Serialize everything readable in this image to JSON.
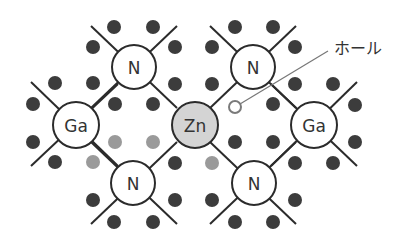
{
  "diagram": {
    "title_partial": "",
    "colors": {
      "electron": "#3c3c3c",
      "electron_light": "#9a9a9a",
      "atom_fill": "#ffffff",
      "zn_fill": "#d4d4d4",
      "hole_stroke": "#7a7a7a",
      "bond": "#2b2b2b"
    },
    "atoms": [
      {
        "id": "n-top-left",
        "label": "N",
        "x": 134,
        "y": 67,
        "r": 22,
        "fill": "#ffffff"
      },
      {
        "id": "n-top-right",
        "label": "N",
        "x": 253,
        "y": 67,
        "r": 22,
        "fill": "#ffffff"
      },
      {
        "id": "ga-left",
        "label": "Ga",
        "x": 76,
        "y": 125,
        "r": 23,
        "fill": "#ffffff"
      },
      {
        "id": "zn-center",
        "label": "Zn",
        "x": 195,
        "y": 125,
        "r": 23,
        "fill": "#d4d4d4"
      },
      {
        "id": "ga-right",
        "label": "Ga",
        "x": 314,
        "y": 125,
        "r": 23,
        "fill": "#ffffff"
      },
      {
        "id": "n-bottom-left",
        "label": "N",
        "x": 133,
        "y": 183,
        "r": 22,
        "fill": "#ffffff"
      },
      {
        "id": "n-bottom-right",
        "label": "N",
        "x": 254,
        "y": 183,
        "r": 22,
        "fill": "#ffffff"
      }
    ],
    "bonds": [
      {
        "x1": 91,
        "y1": 26,
        "x2": 177,
        "y2": 108
      },
      {
        "x1": 177,
        "y1": 26,
        "x2": 91,
        "y2": 108
      },
      {
        "x1": 210,
        "y1": 26,
        "x2": 296,
        "y2": 108
      },
      {
        "x1": 296,
        "y1": 26,
        "x2": 210,
        "y2": 108
      },
      {
        "x1": 31,
        "y1": 82,
        "x2": 118,
        "y2": 166
      },
      {
        "x1": 118,
        "y1": 84,
        "x2": 31,
        "y2": 166
      },
      {
        "x1": 91,
        "y1": 142,
        "x2": 177,
        "y2": 224
      },
      {
        "x1": 177,
        "y1": 142,
        "x2": 91,
        "y2": 224
      },
      {
        "x1": 210,
        "y1": 142,
        "x2": 296,
        "y2": 224
      },
      {
        "x1": 296,
        "y1": 142,
        "x2": 210,
        "y2": 224
      },
      {
        "x1": 271,
        "y1": 84,
        "x2": 357,
        "y2": 166
      },
      {
        "x1": 357,
        "y1": 82,
        "x2": 271,
        "y2": 166
      }
    ],
    "electrons": [
      {
        "x": 114,
        "y": 27,
        "shade": "dark"
      },
      {
        "x": 153,
        "y": 27,
        "shade": "dark"
      },
      {
        "x": 235,
        "y": 27,
        "shade": "dark"
      },
      {
        "x": 273,
        "y": 27,
        "shade": "dark"
      },
      {
        "x": 93,
        "y": 47,
        "shade": "dark"
      },
      {
        "x": 175,
        "y": 47,
        "shade": "dark"
      },
      {
        "x": 212,
        "y": 47,
        "shade": "dark"
      },
      {
        "x": 295,
        "y": 47,
        "shade": "dark"
      },
      {
        "x": 55,
        "y": 83,
        "shade": "dark"
      },
      {
        "x": 93,
        "y": 83,
        "shade": "dark"
      },
      {
        "x": 175,
        "y": 84,
        "shade": "dark"
      },
      {
        "x": 212,
        "y": 84,
        "shade": "dark"
      },
      {
        "x": 295,
        "y": 84,
        "shade": "dark"
      },
      {
        "x": 333,
        "y": 84,
        "shade": "dark"
      },
      {
        "x": 33,
        "y": 104,
        "shade": "dark"
      },
      {
        "x": 115,
        "y": 104,
        "shade": "dark"
      },
      {
        "x": 153,
        "y": 104,
        "shade": "dark"
      },
      {
        "x": 273,
        "y": 104,
        "shade": "dark"
      },
      {
        "x": 355,
        "y": 105,
        "shade": "dark"
      },
      {
        "x": 33,
        "y": 142,
        "shade": "dark"
      },
      {
        "x": 115,
        "y": 142,
        "shade": "light"
      },
      {
        "x": 153,
        "y": 142,
        "shade": "light"
      },
      {
        "x": 235,
        "y": 142,
        "shade": "dark"
      },
      {
        "x": 273,
        "y": 142,
        "shade": "dark"
      },
      {
        "x": 355,
        "y": 142,
        "shade": "dark"
      },
      {
        "x": 55,
        "y": 162,
        "shade": "dark"
      },
      {
        "x": 93,
        "y": 162,
        "shade": "light"
      },
      {
        "x": 175,
        "y": 163,
        "shade": "dark"
      },
      {
        "x": 212,
        "y": 163,
        "shade": "light"
      },
      {
        "x": 295,
        "y": 163,
        "shade": "dark"
      },
      {
        "x": 333,
        "y": 163,
        "shade": "dark"
      },
      {
        "x": 93,
        "y": 200,
        "shade": "dark"
      },
      {
        "x": 175,
        "y": 200,
        "shade": "dark"
      },
      {
        "x": 212,
        "y": 200,
        "shade": "dark"
      },
      {
        "x": 295,
        "y": 200,
        "shade": "dark"
      },
      {
        "x": 114,
        "y": 222,
        "shade": "dark"
      },
      {
        "x": 153,
        "y": 222,
        "shade": "dark"
      },
      {
        "x": 235,
        "y": 222,
        "shade": "dark"
      },
      {
        "x": 273,
        "y": 222,
        "shade": "dark"
      }
    ],
    "electron_radius": 7,
    "hole": {
      "x": 235,
      "y": 107,
      "r": 6
    },
    "hole_callout": {
      "label": "ホール",
      "leader": {
        "x1": 240,
        "y1": 104,
        "x2": 328,
        "y2": 51
      },
      "label_x": 334,
      "label_y": 54
    }
  }
}
